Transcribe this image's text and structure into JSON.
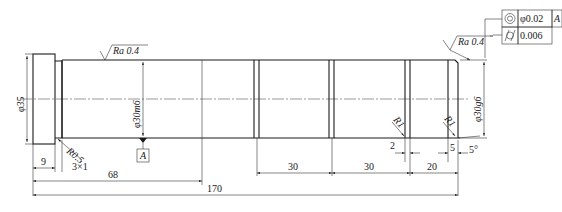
{
  "drawing": {
    "title": "Shaft part drawing",
    "annotations": {
      "dia_left_flange": "φ35",
      "dia_main": "φ30m6",
      "dia_right": "φ30g6",
      "roughness_main": "Ra 0.4",
      "roughness_right": "Ra 0.4",
      "fillet_left": "R0.5",
      "undercut": "3×1",
      "groove_radius_1": "R1",
      "groove_radius_2": "R1",
      "chamfer_angle": "5°",
      "datum": "A"
    },
    "tolerance_frame": [
      {
        "symbol": "concentricity-icon",
        "value": "φ0.02",
        "datum": "A"
      },
      {
        "symbol": "cylindricity-icon",
        "value": "0.006",
        "datum": ""
      }
    ],
    "dimensions": {
      "d9": "9",
      "d68": "68",
      "d170": "170",
      "d30a": "30",
      "d30b": "30",
      "d20": "20",
      "d2": "2",
      "d5": "5"
    }
  }
}
